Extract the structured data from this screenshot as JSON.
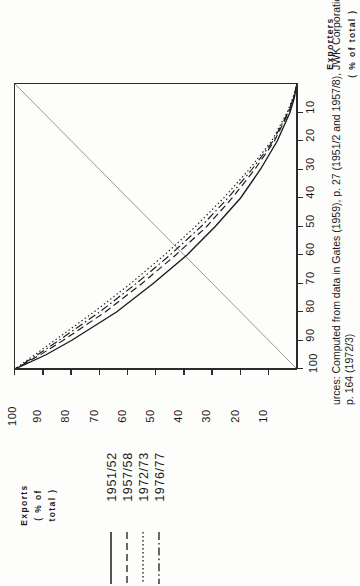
{
  "chart_data": {
    "type": "line",
    "title": "",
    "orientation": "rotated-90-ccw",
    "xlabel": "Exporters",
    "xlabel_unit": "(% of total)",
    "ylabel": "Exports",
    "ylabel_unit_1": "(% of",
    "ylabel_unit_2": "total )",
    "xlim": [
      0,
      100
    ],
    "ylim": [
      0,
      100
    ],
    "xticks": [
      10,
      20,
      30,
      40,
      50,
      60,
      70,
      80,
      90,
      100
    ],
    "yticks": [
      10,
      20,
      30,
      40,
      50,
      60,
      70,
      80,
      90,
      100
    ],
    "grid": false,
    "legend_position": "bottom-left",
    "diagonal_reference_line": true,
    "x": [
      0,
      5,
      10,
      20,
      30,
      40,
      50,
      60,
      70,
      80,
      90,
      95,
      100
    ],
    "series": [
      {
        "name": "1951/52",
        "dash": "solid",
        "values": [
          0,
          1,
          2.5,
          7,
          13,
          20,
          29,
          39,
          51,
          64,
          80,
          89,
          100
        ]
      },
      {
        "name": "1957/58",
        "dash": "dashed",
        "values": [
          0,
          1.2,
          3,
          8,
          15,
          23,
          32,
          43,
          55,
          68,
          83,
          91,
          100
        ]
      },
      {
        "name": "1972/73",
        "dash": "dotted",
        "values": [
          0,
          1.5,
          3.5,
          9,
          17,
          26,
          36,
          47,
          59,
          72,
          86,
          93,
          100
        ]
      },
      {
        "name": "1976/77",
        "dash": "dashdot",
        "values": [
          0,
          1.3,
          3.2,
          8.5,
          16,
          24.5,
          34,
          45,
          57,
          70,
          84.5,
          92,
          100
        ]
      }
    ]
  },
  "axes": {
    "exporters": {
      "title": "Exporters",
      "unit": "( % of total )",
      "unit_pct": "%",
      "unit_pre": "(",
      "unit_post": " of total )",
      "ticks": [
        "10",
        "20",
        "30",
        "40",
        "50",
        "60",
        "70",
        "80",
        "90",
        "100"
      ]
    },
    "exports": {
      "title": "Exports",
      "unit_line1": "( % of",
      "unit_line2": "total )",
      "ticks": [
        "100",
        "90",
        "80",
        "70",
        "60",
        "50",
        "40",
        "30",
        "20",
        "10"
      ]
    }
  },
  "legend": {
    "entries": [
      {
        "label": "1951/52",
        "style": "solid"
      },
      {
        "label": "1957/58",
        "style": "dashed"
      },
      {
        "label": "1972/73",
        "style": "dotted"
      },
      {
        "label": "1976/77",
        "style": "dashdot"
      }
    ]
  },
  "source": {
    "line1": "urces: Computed from data in Gates (1959), p. 27 (1951/2 and 1957/8), JWK Corporation (1976),",
    "line2": "p. 164 (1972/3)",
    "line3": ""
  },
  "colors": {
    "ink": "#1a1a1a",
    "axis": "#2b2b2b",
    "diagonal": "#8c8c8c",
    "paper": "#fdfdfc"
  }
}
